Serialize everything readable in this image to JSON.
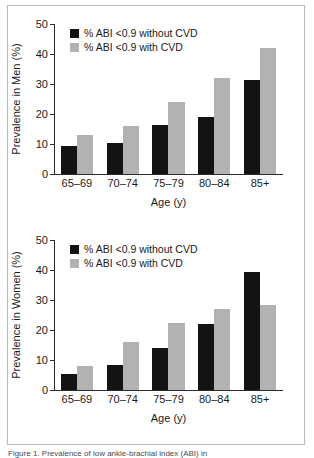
{
  "figure": {
    "caption": "Figure 1. Prevalence of low ankle-brachial index (ABI) in"
  },
  "legend": {
    "series_black_label": "% ABI <0.9 without CVD",
    "series_gray_label": "% ABI <0.9 with CVD",
    "color_black": "#131313",
    "color_gray": "#b2b2b2"
  },
  "axis": {
    "y_ticks": [
      "0",
      "10",
      "20",
      "30",
      "40",
      "50"
    ],
    "x_categories": [
      "65–69",
      "70–74",
      "75–79",
      "80–84",
      "85+"
    ],
    "x_title": "Age (y)"
  },
  "chart_data": [
    {
      "type": "bar",
      "title": "",
      "xlabel": "Age (y)",
      "ylabel": "Prevalence in Men (%)",
      "ylim": [
        0,
        50
      ],
      "yticks": [
        0,
        10,
        20,
        30,
        40,
        50
      ],
      "grid": false,
      "legend_position": "top-left",
      "categories": [
        "65–69",
        "70–74",
        "75–79",
        "80–84",
        "85+"
      ],
      "series": [
        {
          "name": "% ABI <0.9 without CVD",
          "color": "#131313",
          "values": [
            9.5,
            10.5,
            16.5,
            19.0,
            31.5
          ]
        },
        {
          "name": "% ABI <0.9 with CVD",
          "color": "#b2b2b2",
          "values": [
            13.0,
            16.0,
            24.0,
            32.0,
            42.0
          ]
        }
      ]
    },
    {
      "type": "bar",
      "title": "",
      "xlabel": "Age (y)",
      "ylabel": "Prevalence in Women (%)",
      "ylim": [
        0,
        50
      ],
      "yticks": [
        0,
        10,
        20,
        30,
        40,
        50
      ],
      "grid": false,
      "legend_position": "top-left",
      "categories": [
        "65–69",
        "70–74",
        "75–79",
        "80–84",
        "85+"
      ],
      "series": [
        {
          "name": "% ABI <0.9 without CVD",
          "color": "#131313",
          "values": [
            5.5,
            8.5,
            14.0,
            22.0,
            39.5
          ]
        },
        {
          "name": "% ABI <0.9 with CVD",
          "color": "#b2b2b2",
          "values": [
            8.0,
            16.0,
            22.5,
            27.0,
            28.5
          ]
        }
      ]
    }
  ]
}
